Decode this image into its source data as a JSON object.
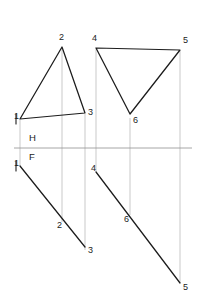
{
  "drawing": {
    "title": "Orthographic projection of two triangles",
    "type": "descriptive-geometry",
    "width": 199,
    "height": 307,
    "background_color": "#ffffff",
    "object_line_color": "#1c1c1c",
    "projector_line_color": "#b3b3b3",
    "fold_line_color": "#8f8f8f"
  },
  "fold_line": {
    "name": "H/F reference line",
    "x1": 14,
    "y1": 148,
    "x2": 192,
    "y2": 148,
    "labels": {
      "horizontal": "H",
      "frontal": "F",
      "horizontal_x": 29,
      "horizontal_y": 138,
      "frontal_x": 29,
      "frontal_y": 157
    }
  },
  "top_view": {
    "name": "horizontal projection",
    "triangle_a": {
      "name": "triangle-1-2-3-top",
      "vertices": [
        {
          "label": "1",
          "x": 20,
          "y": 119,
          "label_x": 14,
          "label_y": 117
        },
        {
          "label": "2",
          "x": 62,
          "y": 47,
          "label_x": 59,
          "label_y": 38
        },
        {
          "label": "3",
          "x": 85,
          "y": 113,
          "label_x": 88,
          "label_y": 113
        }
      ]
    },
    "triangle_b": {
      "name": "triangle-4-5-6-top",
      "vertices": [
        {
          "label": "4",
          "x": 96,
          "y": 48,
          "label_x": 92,
          "label_y": 39
        },
        {
          "label": "5",
          "x": 180,
          "y": 50,
          "label_x": 183,
          "label_y": 41
        },
        {
          "label": "6",
          "x": 130,
          "y": 114,
          "label_x": 133,
          "label_y": 121
        }
      ]
    }
  },
  "front_view": {
    "name": "frontal projection",
    "edge_a": {
      "name": "triangle-1-2-3-front-edge-view",
      "x1": 20,
      "y1": 166,
      "x2": 85,
      "y2": 247,
      "points": [
        {
          "label": "1",
          "x": 20,
          "y": 166,
          "label_x": 14,
          "label_y": 164
        },
        {
          "label": "2",
          "x": 62,
          "y": 218,
          "label_x": 57,
          "label_y": 226
        },
        {
          "label": "3",
          "x": 85,
          "y": 247,
          "label_x": 88,
          "label_y": 251
        }
      ]
    },
    "edge_b": {
      "name": "triangle-4-5-6-front-edge-view",
      "x1": 96,
      "y1": 172,
      "x2": 180,
      "y2": 283,
      "points": [
        {
          "label": "4",
          "x": 96,
          "y": 172,
          "label_x": 91,
          "label_y": 169
        },
        {
          "label": "6",
          "x": 130,
          "y": 217,
          "label_x": 124,
          "label_y": 220
        },
        {
          "label": "5",
          "x": 180,
          "y": 283,
          "label_x": 183,
          "label_y": 288
        }
      ]
    }
  },
  "projectors": [
    {
      "name": "projector-vertex-1",
      "x": 20,
      "y1": 120,
      "y2": 166
    },
    {
      "name": "projector-vertex-2",
      "x": 62,
      "y1": 48,
      "y2": 222
    },
    {
      "name": "projector-vertex-3",
      "x": 85,
      "y1": 114,
      "y2": 250
    },
    {
      "name": "projector-vertex-4",
      "x": 96,
      "y1": 49,
      "y2": 172
    },
    {
      "name": "projector-vertex-6",
      "x": 130,
      "y1": 118,
      "y2": 215
    },
    {
      "name": "projector-vertex-5",
      "x": 180,
      "y1": 51,
      "y2": 283
    }
  ],
  "tick_marks": [
    {
      "name": "tick-vertex-1-top",
      "x1": 16,
      "y1": 114,
      "x2": 16,
      "y2": 124
    },
    {
      "name": "tick-vertex-1-front",
      "x1": 16,
      "y1": 161,
      "x2": 16,
      "y2": 171
    }
  ]
}
